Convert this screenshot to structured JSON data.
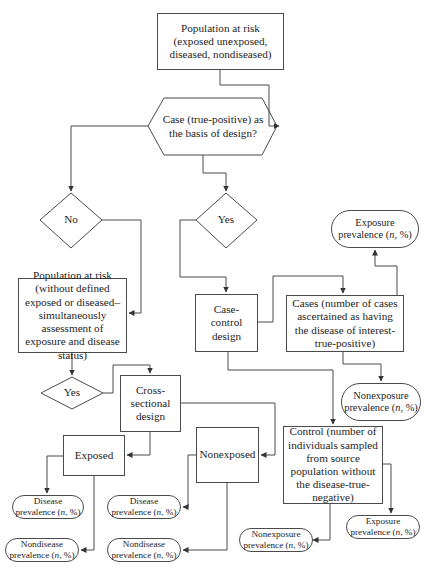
{
  "nodes": {
    "population_at_risk": "Population at risk (exposed unexposed, diseased, nondiseased)",
    "case_decision": "Case (true-positive) as the basis of design?",
    "no": "No",
    "yes_upper": "Yes",
    "population_without_defined": "Population at risk (without defined exposed or diseased– simultaneously assessment of exposure and disease status)",
    "yes_lower": "Yes",
    "cross_sectional": "Cross-sectional design",
    "case_control": "Case-control design",
    "cases": "Cases (number of cases ascertained as having the disease of interest-true-positive)",
    "control": "Control (number of individuals sampled from source population without the disease-true-negative)",
    "exposed": "Exposed",
    "nonexposed": "Nonexposed",
    "exposure_prevalence_cases": "Exposure prevalence (n, %)",
    "nonexposure_prevalence_cases": "Nonexposure prevalence (n, %)",
    "nonexposure_prevalence_control": "Nonexposure prevalence (n, %)",
    "exposure_prevalence_control": "Exposure prevalence (n, %)",
    "disease_prevalence_exposed": "Disease prevalence (n, %)",
    "nondisease_prevalence_exposed": "Nondisease prevalence (n, %)",
    "disease_prevalence_nonexposed": "Disease prevalence (n, %)",
    "nondisease_prevalence_nonexposed": "Nondisease prevalence (n, %)"
  },
  "terminal_parts": {
    "exposure": "Exposure",
    "nonexposure": "Nonexposure",
    "disease": "Disease",
    "nondisease": "Nondisease",
    "prevalence_prefix": "prevalence (",
    "n": "n",
    "suffix": ", %)"
  },
  "colors": {
    "line": "#4a4a4a",
    "text": "#1e1e1e",
    "background": "#ffffff"
  }
}
